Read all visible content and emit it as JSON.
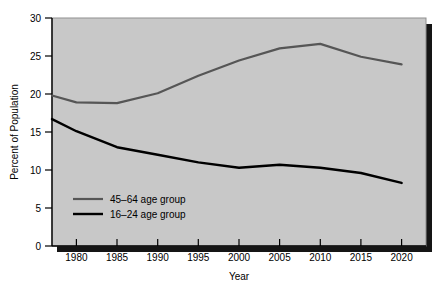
{
  "chart_data": {
    "type": "line",
    "title": "",
    "xlabel": "Year",
    "ylabel": "Percent of Population",
    "xlim": [
      1977,
      2023
    ],
    "ylim": [
      0,
      30
    ],
    "grid": false,
    "legend_position": "inside lower-left",
    "xticks": [
      1980,
      1985,
      1990,
      1995,
      2000,
      2005,
      2010,
      2015,
      2020
    ],
    "xtick_labels": [
      "1980",
      "1985",
      "1990",
      "1995",
      "2000",
      "2005",
      "2010",
      "2015",
      "2020"
    ],
    "yticks": [
      0,
      5,
      10,
      15,
      20,
      25,
      30
    ],
    "ytick_labels": [
      "0",
      "5",
      "10",
      "15",
      "20",
      "25",
      "30"
    ],
    "series": [
      {
        "name": "45–64 age group",
        "color": "#565656",
        "x": [
          1977,
          1980,
          1985,
          1990,
          1995,
          2000,
          2005,
          2010,
          2015,
          2020
        ],
        "values": [
          19.8,
          18.9,
          18.8,
          20.1,
          22.4,
          24.4,
          26.0,
          26.6,
          24.9,
          23.9
        ]
      },
      {
        "name": "16–24 age group",
        "color": "#000000",
        "x": [
          1977,
          1980,
          1985,
          1990,
          1995,
          2000,
          2005,
          2010,
          2015,
          2020
        ],
        "values": [
          16.7,
          15.1,
          13.0,
          12.0,
          11.0,
          10.3,
          10.7,
          10.3,
          9.6,
          8.3
        ]
      }
    ]
  },
  "axis": {
    "ylabel": "Percent of Population",
    "xlabel": "Year"
  },
  "legend": {
    "entries": [
      {
        "label": "45–64 age group"
      },
      {
        "label": "16–24 age group"
      }
    ]
  },
  "colors": {
    "panel_background": "#c8c8c8",
    "figure_background": "#ffffff",
    "axis": "#000000",
    "shadow": "#1a1a1a",
    "series_45_64": "#565656",
    "series_16_24": "#000000"
  }
}
